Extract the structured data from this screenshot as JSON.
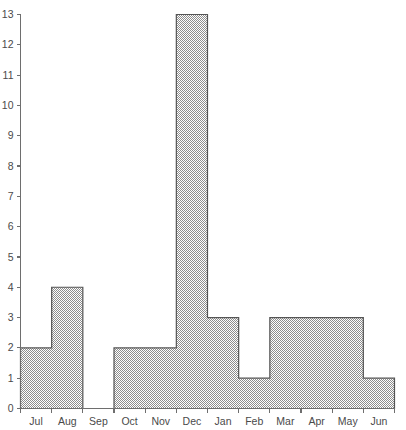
{
  "chart_data": {
    "type": "bar",
    "title": "",
    "subtitle": "",
    "xlabel": "",
    "ylabel": "",
    "categories": [
      "Jul",
      "Aug",
      "Sep",
      "Oct",
      "Nov",
      "Dec",
      "Jan",
      "Feb",
      "Mar",
      "Apr",
      "May",
      "Jun"
    ],
    "values": [
      2,
      4,
      0,
      2,
      2,
      13,
      3,
      1,
      3,
      3,
      3,
      1
    ],
    "xlim": [
      0,
      12
    ],
    "ylim": [
      0,
      13
    ],
    "y_ticks": [
      0,
      1,
      2,
      3,
      4,
      5,
      6,
      7,
      8,
      9,
      10,
      11,
      12,
      13
    ],
    "y_tick_labels": [
      "0",
      "1",
      "2",
      "3",
      "4",
      "5",
      "6",
      "7",
      "8",
      "9",
      "10",
      "11",
      "12",
      "13"
    ],
    "x_tick_labels": [
      "Jul",
      "Aug",
      "Sep",
      "Oct",
      "Nov",
      "Dec",
      "Jan",
      "Feb",
      "Mar",
      "Apr",
      "May",
      "Jun"
    ],
    "grid": false,
    "legend": false,
    "legend_position": "none",
    "annotations": [],
    "style": {
      "fill_pattern": "50-percent-checkerboard-dither",
      "fill_color": "#9a9a9a",
      "background_color": "#ffffff",
      "outline_color": "#555555",
      "axis_color": "#6e6e6e",
      "text_color": "#4a4a4a",
      "bars_merge_adjacent_equal": true
    }
  },
  "axes": {
    "y_axis_name": "y-axis",
    "x_axis_name": "x-axis"
  }
}
